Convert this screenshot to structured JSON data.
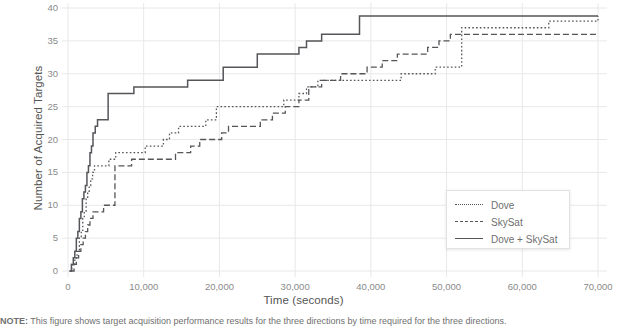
{
  "chart_data": {
    "type": "line",
    "title": "",
    "xlabel": "Time (seconds)",
    "ylabel": "Number of Acquired Targets",
    "xlim": [
      -2500,
      72500
    ],
    "ylim": [
      -1,
      41
    ],
    "xticks": [
      0,
      10000,
      20000,
      30000,
      40000,
      50000,
      60000,
      70000
    ],
    "xticklabels": [
      "0",
      "10,000",
      "20,000",
      "30,000",
      "40,000",
      "50,000",
      "60,000",
      "70,000"
    ],
    "yticks": [
      0,
      5,
      10,
      15,
      20,
      25,
      30,
      35,
      40
    ],
    "yticklabels": [
      "0",
      "5",
      "10",
      "15",
      "20",
      "25",
      "30",
      "35",
      "40"
    ],
    "grid": true,
    "legend_position": "lower right",
    "line_color": "#55565a",
    "grid_color": "#e8e8e8",
    "drawstyle": "steps-post",
    "series": [
      {
        "name": "Dove",
        "style": "dotted",
        "points": [
          [
            200,
            0
          ],
          [
            500,
            1
          ],
          [
            900,
            2
          ],
          [
            1200,
            3
          ],
          [
            1500,
            5
          ],
          [
            1750,
            6
          ],
          [
            1950,
            8
          ],
          [
            2150,
            9
          ],
          [
            2400,
            11
          ],
          [
            2600,
            12
          ],
          [
            2800,
            13
          ],
          [
            3000,
            14
          ],
          [
            3250,
            15
          ],
          [
            3500,
            16
          ],
          [
            4200,
            16
          ],
          [
            5400,
            17
          ],
          [
            6100,
            17
          ],
          [
            6300,
            18
          ],
          [
            9500,
            18
          ],
          [
            10200,
            19
          ],
          [
            11800,
            19
          ],
          [
            12600,
            20
          ],
          [
            13400,
            21
          ],
          [
            14600,
            22
          ],
          [
            17400,
            22
          ],
          [
            18200,
            23
          ],
          [
            19600,
            25
          ],
          [
            27000,
            25
          ],
          [
            28500,
            26
          ],
          [
            30500,
            27
          ],
          [
            31500,
            28
          ],
          [
            33000,
            29
          ],
          [
            38000,
            29
          ],
          [
            44000,
            30
          ],
          [
            48500,
            31
          ],
          [
            52000,
            37
          ],
          [
            62500,
            37
          ],
          [
            63500,
            38
          ],
          [
            70000,
            38.8
          ]
        ]
      },
      {
        "name": "SkySat",
        "style": "dashed",
        "points": [
          [
            350,
            0
          ],
          [
            800,
            1
          ],
          [
            1100,
            2
          ],
          [
            1400,
            3
          ],
          [
            1700,
            4
          ],
          [
            2000,
            5
          ],
          [
            2300,
            6
          ],
          [
            2600,
            7
          ],
          [
            2900,
            8
          ],
          [
            3300,
            9
          ],
          [
            4200,
            9
          ],
          [
            4700,
            10
          ],
          [
            6000,
            10
          ],
          [
            6200,
            16
          ],
          [
            7400,
            16
          ],
          [
            8400,
            17
          ],
          [
            13000,
            17
          ],
          [
            14200,
            18
          ],
          [
            16200,
            19
          ],
          [
            17400,
            20
          ],
          [
            19500,
            20
          ],
          [
            20300,
            21
          ],
          [
            21200,
            22
          ],
          [
            24500,
            22
          ],
          [
            25400,
            23
          ],
          [
            27000,
            24
          ],
          [
            28700,
            25
          ],
          [
            30500,
            26
          ],
          [
            31800,
            28
          ],
          [
            33500,
            29
          ],
          [
            36000,
            30
          ],
          [
            39500,
            31
          ],
          [
            41500,
            32
          ],
          [
            43500,
            33
          ],
          [
            46500,
            33
          ],
          [
            47500,
            34
          ],
          [
            49000,
            35
          ],
          [
            50500,
            36
          ],
          [
            70000,
            36
          ]
        ]
      },
      {
        "name": "Dove + SkySat",
        "style": "solid",
        "points": [
          [
            200,
            0
          ],
          [
            450,
            1
          ],
          [
            700,
            2
          ],
          [
            900,
            3
          ],
          [
            1100,
            5
          ],
          [
            1300,
            6
          ],
          [
            1500,
            8
          ],
          [
            1700,
            9
          ],
          [
            1900,
            11
          ],
          [
            2100,
            12
          ],
          [
            2300,
            13
          ],
          [
            2500,
            15
          ],
          [
            2700,
            16
          ],
          [
            2900,
            18
          ],
          [
            3100,
            19
          ],
          [
            3300,
            21
          ],
          [
            3600,
            22
          ],
          [
            3900,
            23
          ],
          [
            4300,
            23
          ],
          [
            5300,
            27
          ],
          [
            6300,
            27
          ],
          [
            8700,
            28
          ],
          [
            14500,
            28
          ],
          [
            15800,
            29
          ],
          [
            19500,
            29
          ],
          [
            20500,
            31
          ],
          [
            24000,
            31
          ],
          [
            25000,
            33
          ],
          [
            29500,
            33
          ],
          [
            30500,
            34
          ],
          [
            31500,
            35
          ],
          [
            33500,
            36
          ],
          [
            37500,
            36
          ],
          [
            38500,
            38.8
          ],
          [
            70000,
            38.8
          ]
        ]
      }
    ]
  },
  "legend": {
    "items": [
      {
        "label": "Dove"
      },
      {
        "label": "SkySat"
      },
      {
        "label": "Dove + SkySat"
      }
    ]
  },
  "caption": {
    "prefix": "NOTE:",
    "text": "This figure shows target acquisition performance results for the three directions by time required for the three directions."
  }
}
